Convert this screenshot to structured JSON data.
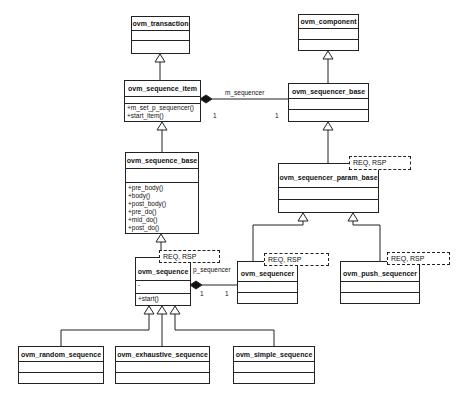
{
  "diagram": {
    "type": "uml-class-diagram",
    "classes": {
      "ovm_transaction": {
        "name": "ovm_transaction",
        "attributes": [],
        "methods": []
      },
      "ovm_sequence_item": {
        "name": "ovm_sequence_item",
        "attributes": [],
        "methods": [
          "+m_set_p_sequencer()",
          "+start_item()"
        ]
      },
      "ovm_sequence_base": {
        "name": "ovm_sequence_base",
        "attributes": [],
        "methods": [
          "+pre_body()",
          "+body()",
          "+post_body()",
          "+pre_do()",
          "+mid_do()",
          "+post_do()"
        ]
      },
      "ovm_sequence": {
        "name": "ovm_sequence",
        "template": "REQ, RSP",
        "attributes": [
          "-"
        ],
        "methods": [
          "+start()"
        ]
      },
      "ovm_component": {
        "name": "ovm_component",
        "attributes": [],
        "methods": []
      },
      "ovm_sequencer_base": {
        "name": "ovm_sequencer_base",
        "attributes": [],
        "methods": []
      },
      "ovm_sequencer_param_base": {
        "name": "ovm_sequencer_param_base",
        "template": "REQ, RSP",
        "attributes": [],
        "methods": []
      },
      "ovm_sequencer": {
        "name": "ovm_sequencer",
        "template": "REQ, RSP",
        "attributes": [],
        "methods": []
      },
      "ovm_push_sequencer": {
        "name": "ovm_push_sequencer",
        "template": "REQ, RSP",
        "attributes": [],
        "methods": []
      },
      "ovm_random_sequence": {
        "name": "ovm_random_sequence",
        "attributes": [],
        "methods": []
      },
      "ovm_exhaustive_sequence": {
        "name": "ovm_exhaustive_sequence",
        "attributes": [],
        "methods": []
      },
      "ovm_simple_sequence": {
        "name": "ovm_simple_sequence",
        "attributes": [],
        "methods": []
      }
    },
    "relationships": {
      "m_sequencer": {
        "label": "m_sequencer",
        "from": "ovm_sequence_item",
        "to": "ovm_sequencer_base",
        "kind": "composition",
        "mult_from": "1",
        "mult_to": "1"
      },
      "p_sequencer": {
        "label": "p_sequencer",
        "from": "ovm_sequence",
        "to": "ovm_sequencer",
        "kind": "composition",
        "mult_from": "1",
        "mult_to": "1"
      },
      "inheritance": [
        [
          "ovm_sequence_item",
          "ovm_transaction"
        ],
        [
          "ovm_sequence_base",
          "ovm_sequence_item"
        ],
        [
          "ovm_sequence",
          "ovm_sequence_base"
        ],
        [
          "ovm_sequencer_base",
          "ovm_component"
        ],
        [
          "ovm_sequencer_param_base",
          "ovm_sequencer_base"
        ],
        [
          "ovm_sequencer",
          "ovm_sequencer_param_base"
        ],
        [
          "ovm_push_sequencer",
          "ovm_sequencer_param_base"
        ],
        [
          "ovm_random_sequence",
          "ovm_sequence"
        ],
        [
          "ovm_exhaustive_sequence",
          "ovm_sequence"
        ],
        [
          "ovm_simple_sequence",
          "ovm_sequence"
        ]
      ]
    }
  }
}
